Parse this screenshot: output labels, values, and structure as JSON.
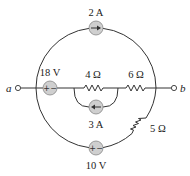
{
  "diagram": {
    "type": "circuit",
    "terminals": {
      "a": "a",
      "b": "b"
    },
    "components": {
      "current_source_top": {
        "label": "2 A",
        "direction": "right"
      },
      "voltage_source_left": {
        "label": "18 V",
        "polarity": "+ −"
      },
      "resistor_4": {
        "label": "4 Ω"
      },
      "resistor_6": {
        "label": "6 Ω"
      },
      "current_source_middle": {
        "label": "3 A",
        "direction": "left"
      },
      "resistor_5": {
        "label": "5 Ω"
      },
      "voltage_source_bottom": {
        "label": "10 V",
        "polarity": "+ −"
      }
    },
    "signs": {
      "plus": "+",
      "minus": "−"
    },
    "colors": {
      "wire": "#333333",
      "source_fill": "#cfcfcf",
      "background": "#ffffff"
    }
  }
}
